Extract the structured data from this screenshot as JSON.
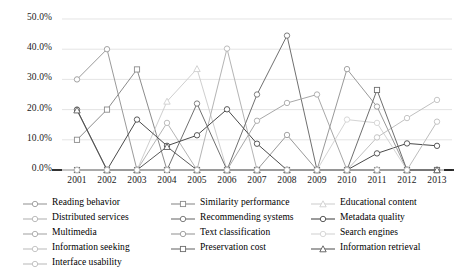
{
  "chart_data": {
    "type": "line",
    "title": "",
    "xlabel": "",
    "ylabel": "",
    "grid": true,
    "legend_position": "bottom",
    "ylim": [
      0,
      50
    ],
    "ytick_labels": [
      "0.0%",
      "10.0%",
      "20.0%",
      "30.0%",
      "40.0%",
      "50.0%"
    ],
    "ytick_values": [
      0,
      10,
      20,
      30,
      40,
      50
    ],
    "categories": [
      "2001",
      "2002",
      "2003",
      "2004",
      "2005",
      "2006",
      "2007",
      "2008",
      "2009",
      "2010",
      "2011",
      "2012",
      "2013"
    ],
    "series": [
      {
        "name": "Reading behavior",
        "marker": "circle",
        "color": "#9a9a9a",
        "values": [
          30.0,
          40.0,
          0.0,
          0.0,
          0.0,
          0.0,
          0.0,
          0.0,
          0.0,
          0.0,
          0.0,
          0.0,
          0.0
        ]
      },
      {
        "name": "Similarity performance",
        "marker": "square",
        "color": "#8c8c8c",
        "values": [
          10.0,
          20.0,
          33.3,
          0.0,
          0.0,
          0.0,
          0.0,
          0.0,
          0.0,
          0.0,
          0.0,
          0.0,
          0.0
        ]
      },
      {
        "name": "Educational content",
        "marker": "triangle",
        "color": "#cfcfcf",
        "values": [
          0.0,
          0.0,
          0.0,
          22.7,
          33.5,
          0.0,
          0.0,
          0.0,
          0.0,
          0.0,
          0.0,
          0.0,
          0.0
        ]
      },
      {
        "name": "Distributed services",
        "marker": "circle",
        "color": "#b4b4b4",
        "values": [
          0.0,
          0.0,
          0.0,
          15.6,
          0.0,
          40.2,
          0.0,
          0.0,
          0.0,
          0.0,
          0.0,
          0.0,
          0.0
        ]
      },
      {
        "name": "Recommending systems",
        "marker": "circle",
        "color": "#707070",
        "values": [
          0.0,
          0.0,
          0.0,
          0.0,
          22.0,
          0.0,
          25.0,
          44.5,
          0.0,
          0.0,
          0.0,
          0.0,
          0.0
        ]
      },
      {
        "name": "Metadata quality",
        "marker": "circle",
        "color": "#4a4a4a",
        "values": [
          20.0,
          0.0,
          16.7,
          8.0,
          11.5,
          20.1,
          8.7,
          0.0,
          0.0,
          0.0,
          5.5,
          8.8,
          8.0
        ]
      },
      {
        "name": "Multimedia",
        "marker": "circle",
        "color": "#a8a8a8",
        "values": [
          0.0,
          0.0,
          0.0,
          0.0,
          0.0,
          0.0,
          16.3,
          22.2,
          25.0,
          0.0,
          0.0,
          0.0,
          0.0
        ]
      },
      {
        "name": "Text classification",
        "marker": "circle",
        "color": "#999999",
        "values": [
          0.0,
          0.0,
          0.0,
          0.0,
          0.0,
          0.0,
          0.0,
          11.6,
          0.0,
          33.4,
          21.0,
          0.0,
          0.0
        ]
      },
      {
        "name": "Search engines",
        "marker": "circle",
        "color": "#d4d4d4",
        "values": [
          0.0,
          0.0,
          0.0,
          0.0,
          0.0,
          0.0,
          0.0,
          0.0,
          0.0,
          16.7,
          15.6,
          0.0,
          0.0
        ]
      },
      {
        "name": "Information seeking",
        "marker": "circle",
        "color": "#c0c0c0",
        "values": [
          0.0,
          0.0,
          0.0,
          0.0,
          0.0,
          0.0,
          0.0,
          0.0,
          0.0,
          0.0,
          10.8,
          17.2,
          23.2
        ]
      },
      {
        "name": "Preservation cost",
        "marker": "square",
        "color": "#6e6e6e",
        "values": [
          0.0,
          0.0,
          0.0,
          0.0,
          0.0,
          0.0,
          0.0,
          0.0,
          0.0,
          0.0,
          26.5,
          0.0,
          0.0
        ]
      },
      {
        "name": "Information retrieval",
        "marker": "triangle",
        "color": "#5a5a5a",
        "values": [
          19.8,
          0.0,
          0.0,
          7.7,
          0.0,
          0.0,
          0.0,
          0.0,
          0.0,
          0.0,
          0.0,
          0.0,
          0.0
        ]
      },
      {
        "name": "Interface usability",
        "marker": "circle",
        "color": "#bdbdbd",
        "values": [
          0.0,
          0.0,
          0.0,
          0.0,
          0.0,
          0.0,
          0.0,
          0.0,
          0.0,
          0.0,
          0.0,
          0.0,
          16.0
        ]
      }
    ]
  },
  "legend": {
    "columns": [
      [
        {
          "label": "Reading behavior",
          "marker": "circle",
          "color": "#9a9a9a"
        },
        {
          "label": "Distributed services",
          "marker": "circle",
          "color": "#b4b4b4"
        },
        {
          "label": "Multimedia",
          "marker": "circle",
          "color": "#a8a8a8"
        },
        {
          "label": "Information seeking",
          "marker": "circle",
          "color": "#c0c0c0"
        },
        {
          "label": "Interface usability",
          "marker": "circle",
          "color": "#bdbdbd"
        }
      ],
      [
        {
          "label": "Similarity performance",
          "marker": "square",
          "color": "#8c8c8c"
        },
        {
          "label": "Recommending systems",
          "marker": "circle",
          "color": "#707070"
        },
        {
          "label": "Text classification",
          "marker": "circle",
          "color": "#999999"
        },
        {
          "label": "Preservation cost",
          "marker": "square",
          "color": "#6e6e6e"
        }
      ],
      [
        {
          "label": "Educational content",
          "marker": "triangle",
          "color": "#cfcfcf"
        },
        {
          "label": "Metadata quality",
          "marker": "circle",
          "color": "#4a4a4a"
        },
        {
          "label": "Search engines",
          "marker": "circle",
          "color": "#d4d4d4"
        },
        {
          "label": "Information retrieval",
          "marker": "triangle",
          "color": "#5a5a5a"
        }
      ]
    ]
  },
  "style": {
    "grid_color": "#d9d9d9",
    "baseline_color": "#808080",
    "background": "#ffffff"
  }
}
